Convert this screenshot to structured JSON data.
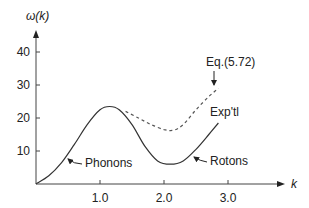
{
  "chart_data": {
    "type": "line",
    "title": "",
    "xlabel": "k",
    "ylabel": "ω(k)",
    "xlim": [
      0,
      3.7
    ],
    "ylim": [
      0,
      45
    ],
    "grid": false,
    "x_ticks": [
      1.0,
      2.0,
      3.0
    ],
    "x_tick_labels": [
      "1.0",
      "2.0",
      "3.0"
    ],
    "y_ticks": [
      10,
      20,
      30,
      40
    ],
    "y_tick_labels": [
      "10",
      "20",
      "30",
      "40"
    ],
    "series": [
      {
        "name": "Exp'tl",
        "style": "solid",
        "x": [
          0.0,
          0.2,
          0.4,
          0.6,
          0.8,
          1.0,
          1.15,
          1.3,
          1.5,
          1.7,
          1.9,
          2.1,
          2.3,
          2.5,
          2.7,
          2.85
        ],
        "y": [
          0.0,
          2.5,
          6.5,
          12.0,
          18.0,
          22.5,
          23.5,
          22.5,
          18.0,
          11.5,
          7.0,
          6.0,
          7.0,
          10.5,
          15.0,
          18.5
        ]
      },
      {
        "name": "Eq.(5.72)",
        "style": "dashed",
        "x": [
          1.4,
          1.6,
          1.8,
          2.0,
          2.15,
          2.3,
          2.5,
          2.7,
          2.85
        ],
        "y": [
          22.0,
          20.0,
          18.0,
          16.5,
          16.3,
          18.0,
          22.5,
          26.5,
          29.0
        ]
      }
    ],
    "annotations": [
      {
        "text": "Eq.(5.72)",
        "target": "dashed curve end",
        "arrow": true
      },
      {
        "text": "Exp'tl",
        "target": "solid curve end",
        "arrow": false
      },
      {
        "text": "Phonons",
        "target": "linear low-k region",
        "arrow": true
      },
      {
        "text": "Rotons",
        "target": "minimum near k≈2",
        "arrow": true
      }
    ]
  }
}
